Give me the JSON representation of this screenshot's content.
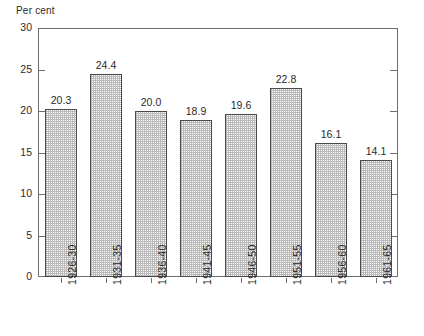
{
  "chart_data": {
    "type": "bar",
    "title": "",
    "subtitle": "",
    "xlabel": "",
    "ylabel": "Per cent",
    "categories": [
      "1926-30",
      "1931-35",
      "1936-40",
      "1941-45",
      "1946-50",
      "1951-55",
      "1956-60",
      "1961-65"
    ],
    "values": [
      20.3,
      24.4,
      20.0,
      18.9,
      19.6,
      22.8,
      16.1,
      14.1
    ],
    "value_labels": [
      "20.3",
      "24.4",
      "20.0",
      "18.9",
      "19.6",
      "22.8",
      "16.1",
      "14.1"
    ],
    "ylim": [
      0,
      30
    ],
    "yticks": [
      0,
      5,
      10,
      15,
      20,
      25,
      30
    ],
    "ytick_labels": [
      "0",
      "5",
      "10",
      "15",
      "20",
      "25",
      "30"
    ],
    "grid": false,
    "legend": null,
    "legend_position": "none",
    "bar_fill": "stipple-dot-pattern",
    "bar_fill_color": "#b9b9b9",
    "bar_edge_color": "#4a4a4a",
    "axis_color": "#6e6e6e",
    "background_color": "#ffffff",
    "text_color": "#2b2b2b",
    "xtick_label_rotation": -90
  }
}
